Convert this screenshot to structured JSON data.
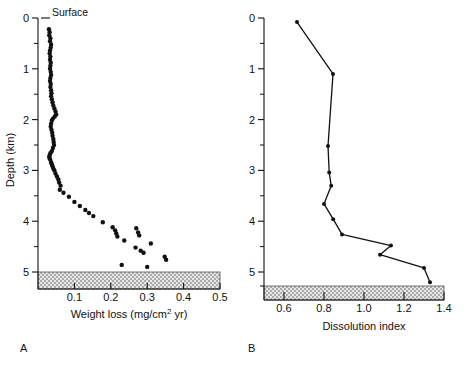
{
  "figure": {
    "panels": [
      {
        "letter": "A",
        "annotation": "Surface",
        "ylabel": "Depth (km)",
        "xlabel_parts": {
          "pre": "Weight loss (mg/cm",
          "sup": "2",
          "post": " yr)"
        },
        "xlabel": "Weight loss (mg/cm2 yr)",
        "seafloor_depth": 5.0
      },
      {
        "letter": "B",
        "ylabel": "Depth (km)",
        "xlabel": "Dissolution index",
        "seafloor_depth": 5.45
      }
    ]
  },
  "chart_data": [
    {
      "type": "scatter",
      "panel": "A",
      "title": "",
      "xlabel": "Weight loss (mg/cm2 yr)",
      "ylabel": "Depth (km)",
      "xlim": [
        0.0,
        0.5
      ],
      "ylim": [
        0.0,
        5.3
      ],
      "y_inverted": true,
      "grid": false,
      "legend": "none",
      "xticks": [
        0.1,
        0.2,
        0.3,
        0.4,
        0.5
      ],
      "xticklabels": [
        "0.1",
        "0.2",
        "0.3",
        "0.4",
        "0.5"
      ],
      "yticks": [
        0,
        1,
        2,
        3,
        4,
        5
      ],
      "yticklabels": [
        "0",
        "1",
        "2",
        "3",
        "4",
        "5"
      ],
      "yminorticks": [
        0.5,
        1.5,
        2.5,
        3.5,
        4.5
      ],
      "annotations": [
        {
          "text": "Surface",
          "x": 0.02,
          "y": 0.0
        }
      ],
      "x": [
        0.03,
        0.032,
        0.031,
        0.034,
        0.033,
        0.036,
        0.035,
        0.033,
        0.032,
        0.034,
        0.033,
        0.035,
        0.034,
        0.033,
        0.035,
        0.036,
        0.034,
        0.033,
        0.035,
        0.034,
        0.036,
        0.037,
        0.036,
        0.038,
        0.04,
        0.042,
        0.045,
        0.048,
        0.05,
        0.046,
        0.041,
        0.038,
        0.036,
        0.035,
        0.037,
        0.039,
        0.04,
        0.042,
        0.043,
        0.044,
        0.041,
        0.038,
        0.034,
        0.032,
        0.031,
        0.033,
        0.036,
        0.038,
        0.04,
        0.042,
        0.045,
        0.048,
        0.052,
        0.056,
        0.058,
        0.062,
        0.06,
        0.07,
        0.085,
        0.1,
        0.115,
        0.13,
        0.14,
        0.152,
        0.178,
        0.205,
        0.212,
        0.215,
        0.218,
        0.23,
        0.237,
        0.27,
        0.275,
        0.278,
        0.268,
        0.282,
        0.29,
        0.3,
        0.31,
        0.348,
        0.352
      ],
      "y": [
        0.22,
        0.28,
        0.34,
        0.4,
        0.46,
        0.52,
        0.58,
        0.64,
        0.7,
        0.76,
        0.82,
        0.88,
        0.94,
        1.0,
        1.06,
        1.12,
        1.18,
        1.24,
        1.3,
        1.36,
        1.42,
        1.48,
        1.54,
        1.6,
        1.66,
        1.72,
        1.78,
        1.84,
        1.9,
        1.94,
        1.98,
        2.02,
        2.08,
        2.14,
        2.2,
        2.26,
        2.32,
        2.38,
        2.44,
        2.5,
        2.56,
        2.62,
        2.66,
        2.7,
        2.74,
        2.78,
        2.84,
        2.88,
        2.92,
        2.96,
        3.0,
        3.06,
        3.12,
        3.18,
        3.24,
        3.3,
        3.38,
        3.44,
        3.52,
        3.62,
        3.7,
        3.78,
        3.84,
        3.9,
        4.02,
        4.12,
        4.18,
        4.24,
        4.3,
        4.86,
        4.38,
        4.14,
        4.22,
        4.28,
        4.52,
        4.58,
        4.62,
        4.9,
        4.44,
        4.7,
        4.76
      ]
    },
    {
      "type": "line",
      "panel": "B",
      "title": "",
      "xlabel": "Dissolution index",
      "ylabel": "Depth (km)",
      "xlim": [
        0.5,
        1.4
      ],
      "ylim": [
        0.0,
        5.45
      ],
      "y_inverted": true,
      "grid": false,
      "legend": "none",
      "markers": true,
      "xticks": [
        0.6,
        0.8,
        1.0,
        1.2,
        1.4
      ],
      "xticklabels": [
        "0.6",
        "0.8",
        "1.0",
        "1.2",
        "1.4"
      ],
      "yticks": [
        0,
        1,
        2,
        3,
        4,
        5
      ],
      "yticklabels": [
        "0",
        "1",
        "2",
        "3",
        "4",
        "5"
      ],
      "yminorticks": [
        0.5,
        1.5,
        2.5,
        3.5,
        4.5
      ],
      "x": [
        0.665,
        0.845,
        0.82,
        0.826,
        0.836,
        0.8,
        0.846,
        0.89,
        1.135,
        1.08,
        1.3,
        1.33
      ],
      "y": [
        0.08,
        1.1,
        2.52,
        3.04,
        3.3,
        3.66,
        3.96,
        4.26,
        4.48,
        4.66,
        4.92,
        5.2
      ]
    }
  ]
}
